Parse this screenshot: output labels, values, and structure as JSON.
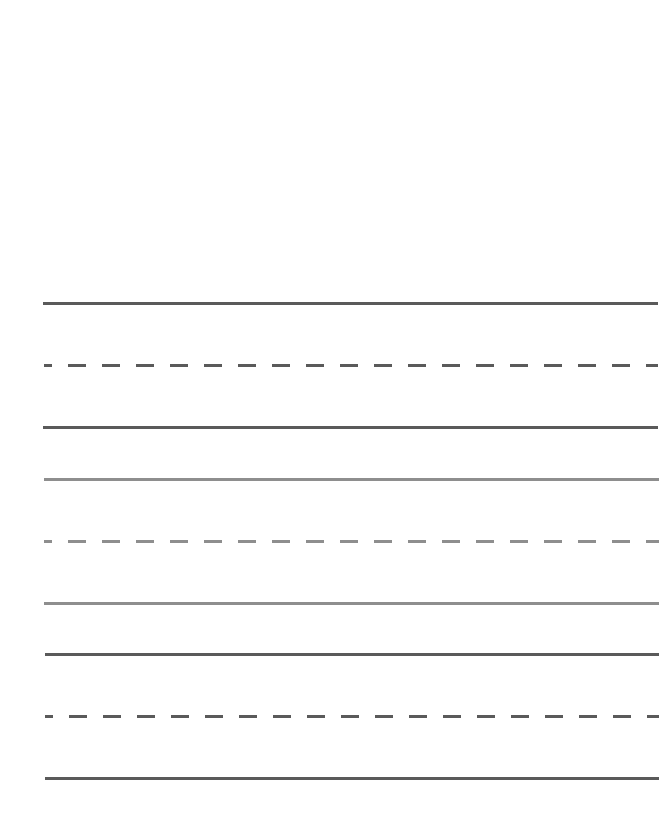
{
  "page": {
    "title": "",
    "background": "#ffffff",
    "width": 665,
    "height": 835
  },
  "handwriting_sheet": {
    "line_groups": [
      {
        "name": "group-1",
        "color": "#5a5a5a",
        "lines": [
          {
            "role": "top",
            "style": "solid",
            "y": 302,
            "x_start": 43,
            "x_end": 658
          },
          {
            "role": "midline",
            "style": "dashed",
            "y": 364,
            "x_start": 44,
            "x_end": 658,
            "dash": 18,
            "gap": 16,
            "first_dash": 8
          },
          {
            "role": "baseline",
            "style": "solid",
            "y": 426,
            "x_start": 43,
            "x_end": 658
          }
        ]
      },
      {
        "name": "group-2",
        "color": "#8e8e8e",
        "lines": [
          {
            "role": "top",
            "style": "solid",
            "y": 478,
            "x_start": 44,
            "x_end": 659
          },
          {
            "role": "midline",
            "style": "dashed",
            "y": 540,
            "x_start": 44,
            "x_end": 659,
            "dash": 18,
            "gap": 16,
            "first_dash": 8
          },
          {
            "role": "baseline",
            "style": "solid",
            "y": 602,
            "x_start": 44,
            "x_end": 659
          }
        ]
      },
      {
        "name": "group-3",
        "color": "#5a5a5a",
        "lines": [
          {
            "role": "top",
            "style": "solid",
            "y": 653,
            "x_start": 45,
            "x_end": 659
          },
          {
            "role": "midline",
            "style": "dashed",
            "y": 715,
            "x_start": 45,
            "x_end": 659,
            "dash": 18,
            "gap": 16,
            "first_dash": 8
          },
          {
            "role": "baseline",
            "style": "solid",
            "y": 777,
            "x_start": 45,
            "x_end": 659
          }
        ]
      }
    ]
  }
}
